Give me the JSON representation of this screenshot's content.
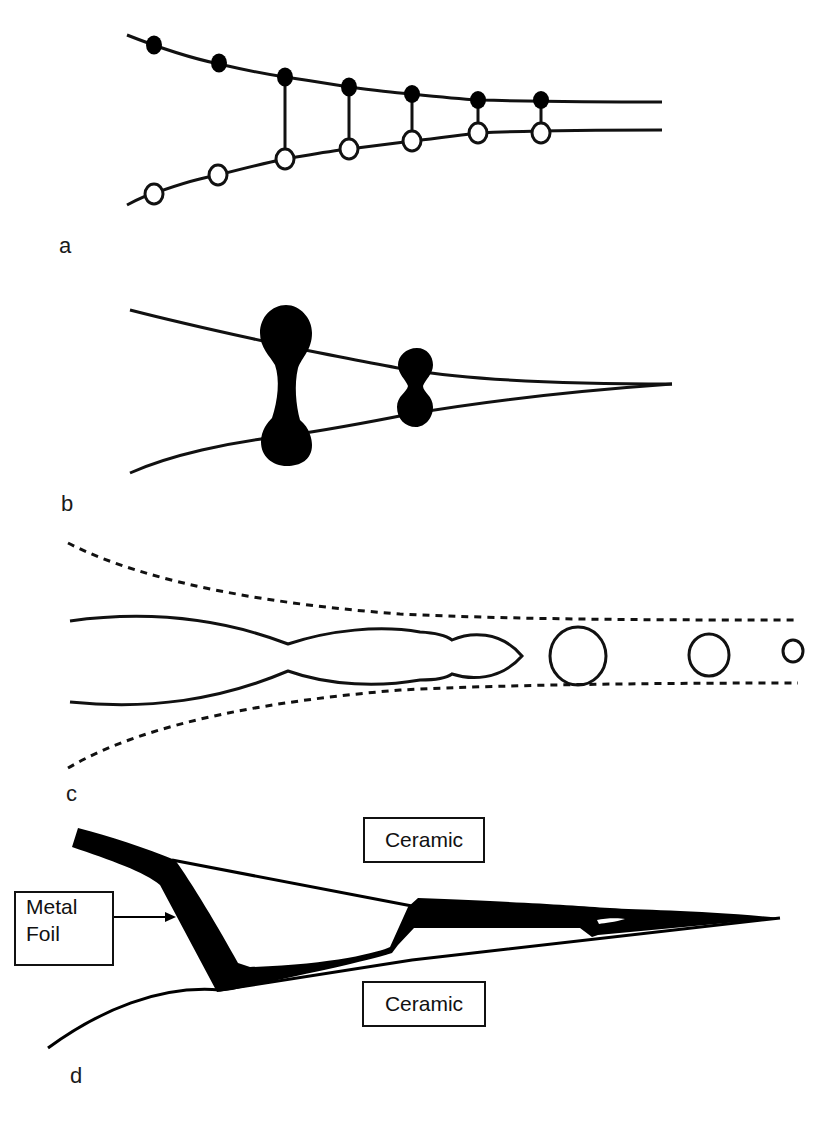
{
  "figure": {
    "panels": [
      {
        "id": "a",
        "label": "a"
      },
      {
        "id": "b",
        "label": "b"
      },
      {
        "id": "c",
        "label": "c"
      },
      {
        "id": "d",
        "label": "d"
      }
    ],
    "panel_d": {
      "ceramic_top_label": "Ceramic",
      "ceramic_bottom_label": "Ceramic",
      "metal_foil_label_line1": "Metal",
      "metal_foil_label_line2": "Foil"
    },
    "colors": {
      "stroke": "#111111",
      "fill_dark": "#000000",
      "background": "#ffffff"
    }
  }
}
